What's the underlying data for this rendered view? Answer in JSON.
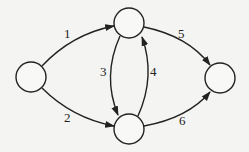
{
  "diagram": {
    "type": "directed-graph",
    "nodes": [
      {
        "id": "s",
        "label": "",
        "cx": 31,
        "cy": 77
      },
      {
        "id": "a",
        "label": "",
        "cx": 129,
        "cy": 23
      },
      {
        "id": "b",
        "label": "",
        "cx": 129,
        "cy": 129
      },
      {
        "id": "t",
        "label": "",
        "cx": 220,
        "cy": 78
      }
    ],
    "edges": [
      {
        "id": "e1",
        "from": "s",
        "to": "a",
        "label": "1"
      },
      {
        "id": "e2",
        "from": "s",
        "to": "b",
        "label": "2"
      },
      {
        "id": "e3",
        "from": "a",
        "to": "b",
        "label": "3"
      },
      {
        "id": "e4",
        "from": "b",
        "to": "a",
        "label": "4"
      },
      {
        "id": "e5",
        "from": "a",
        "to": "t",
        "label": "5"
      },
      {
        "id": "e6",
        "from": "b",
        "to": "t",
        "label": "6"
      }
    ],
    "colors": {
      "stroke": "#222222",
      "background": "#f4f4f2"
    }
  }
}
